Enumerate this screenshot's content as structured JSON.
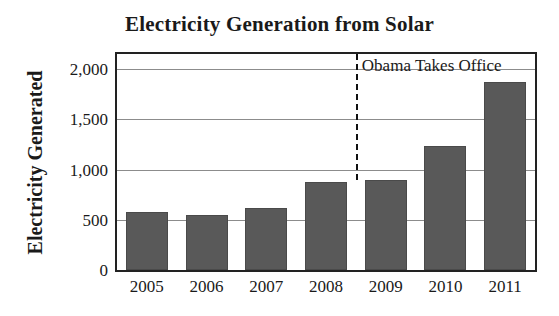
{
  "chart_data": {
    "type": "bar",
    "title": "Electricity Generation from Solar",
    "xlabel": "",
    "ylabel": "Electricity Generated",
    "categories": [
      "2005",
      "2006",
      "2007",
      "2008",
      "2009",
      "2010",
      "2011"
    ],
    "values": [
      575,
      545,
      620,
      875,
      900,
      1235,
      1870
    ],
    "ylim": [
      0,
      2150
    ],
    "yticks": [
      0,
      500,
      1000,
      1500,
      2000
    ],
    "ytick_labels": [
      "0",
      "500",
      "1,000",
      "1,500",
      "2,000"
    ],
    "grid": true,
    "legend": "none",
    "bar_color": "#595959",
    "bar_edge_color": "#4a4a4a",
    "gridline_color": "#8c8c8c",
    "frame_color": "#222222",
    "annotations": [
      {
        "label": "Obama Takes Office",
        "type": "vertical-dashed-line",
        "x_position_between": [
          "2008",
          "2009"
        ],
        "line_color": "#111111",
        "line_style": "dashed"
      }
    ]
  }
}
